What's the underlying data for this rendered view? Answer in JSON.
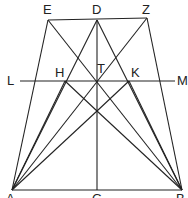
{
  "diagram": {
    "type": "geometric-construction",
    "stroke_color": "#222222",
    "points": {
      "E": [
        48,
        20
      ],
      "D": [
        97,
        20
      ],
      "Z": [
        147,
        18
      ],
      "L": [
        20,
        81
      ],
      "H": [
        65,
        81
      ],
      "T": [
        97,
        81
      ],
      "K": [
        129,
        81
      ],
      "M": [
        175,
        81
      ],
      "X": [
        97,
        111
      ],
      "A": [
        12,
        190
      ],
      "G": [
        97,
        190
      ],
      "B": [
        182,
        190
      ]
    },
    "labels": [
      {
        "id": "E",
        "text": "E",
        "x": 43,
        "y": 3
      },
      {
        "id": "D",
        "text": "D",
        "x": 92,
        "y": 3
      },
      {
        "id": "Z",
        "text": "Z",
        "x": 142,
        "y": 3
      },
      {
        "id": "L",
        "text": "L",
        "x": 7,
        "y": 74
      },
      {
        "id": "H",
        "text": "H",
        "x": 55,
        "y": 66
      },
      {
        "id": "T",
        "text": "T",
        "x": 97,
        "y": 62
      },
      {
        "id": "K",
        "text": "K",
        "x": 131,
        "y": 66
      },
      {
        "id": "M",
        "text": "M",
        "x": 177,
        "y": 74
      },
      {
        "id": "A",
        "text": "A",
        "x": 6,
        "y": 192
      },
      {
        "id": "G",
        "text": "G",
        "x": 92,
        "y": 192
      },
      {
        "id": "B",
        "text": "B",
        "x": 176,
        "y": 192
      }
    ],
    "segments": [
      [
        "E",
        "Z"
      ],
      [
        "A",
        "B"
      ],
      [
        "D",
        "G"
      ],
      [
        "L",
        "M"
      ],
      [
        "A",
        "E"
      ],
      [
        "B",
        "Z"
      ],
      [
        "A",
        "D"
      ],
      [
        "B",
        "D"
      ],
      [
        "E",
        "B"
      ],
      [
        "Z",
        "A"
      ],
      [
        "A",
        "H"
      ],
      [
        "B",
        "K"
      ],
      [
        "H",
        "X"
      ],
      [
        "K",
        "X"
      ],
      [
        "X",
        "B"
      ],
      [
        "X",
        "A"
      ]
    ]
  }
}
